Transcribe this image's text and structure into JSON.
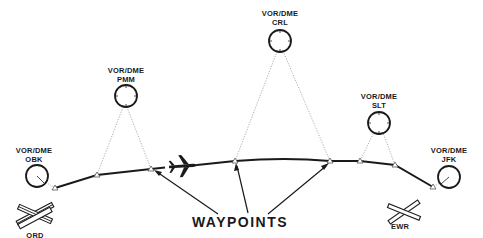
{
  "diagram": {
    "title_label": "WAYPOINTS",
    "stations": [
      {
        "type": "VOR/DME",
        "id": "OBK"
      },
      {
        "type": "VOR/DME",
        "id": "PMM"
      },
      {
        "type": "VOR/DME",
        "id": "CRL"
      },
      {
        "type": "VOR/DME",
        "id": "SLT"
      },
      {
        "type": "VOR/DME",
        "id": "JFK"
      }
    ],
    "airports": [
      {
        "id": "ORD",
        "role": "departure"
      },
      {
        "id": "EWR",
        "role": "arrival"
      }
    ],
    "aircraft_icon": "airplane-icon",
    "colors": {
      "ink": "#1a1a1a",
      "radial": "#9a9a9a",
      "background": "#ffffff"
    }
  }
}
